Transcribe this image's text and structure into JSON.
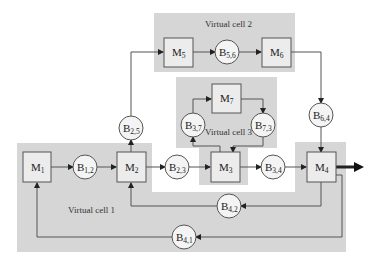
{
  "diagram": {
    "type": "manufacturing-flow-network",
    "virtual_cells": [
      {
        "id": "vc1",
        "label": "Virtual cell 1"
      },
      {
        "id": "vc2",
        "label": "Virtual cell 2"
      },
      {
        "id": "vc3",
        "label": "Virtual cell 3"
      }
    ],
    "machines": [
      {
        "id": "M1",
        "base": "M",
        "sub": "1"
      },
      {
        "id": "M2",
        "base": "M",
        "sub": "2"
      },
      {
        "id": "M3",
        "base": "M",
        "sub": "3"
      },
      {
        "id": "M4",
        "base": "M",
        "sub": "4"
      },
      {
        "id": "M5",
        "base": "M",
        "sub": "5"
      },
      {
        "id": "M6",
        "base": "M",
        "sub": "6"
      },
      {
        "id": "M7",
        "base": "M",
        "sub": "7"
      }
    ],
    "buffers": [
      {
        "id": "B12",
        "base": "B",
        "sub": "1,2"
      },
      {
        "id": "B23",
        "base": "B",
        "sub": "2,3"
      },
      {
        "id": "B34",
        "base": "B",
        "sub": "3,4"
      },
      {
        "id": "B25",
        "base": "B",
        "sub": "2,5"
      },
      {
        "id": "B56",
        "base": "B",
        "sub": "5,6"
      },
      {
        "id": "B64",
        "base": "B",
        "sub": "6,4"
      },
      {
        "id": "B37",
        "base": "B",
        "sub": "3,7"
      },
      {
        "id": "B73",
        "base": "B",
        "sub": "7,3"
      },
      {
        "id": "B42",
        "base": "B",
        "sub": "4,2"
      },
      {
        "id": "B41",
        "base": "B",
        "sub": "4,1"
      }
    ],
    "edges": [
      [
        "M1",
        "B12"
      ],
      [
        "B12",
        "M2"
      ],
      [
        "M2",
        "B23"
      ],
      [
        "B23",
        "M3"
      ],
      [
        "M3",
        "B34"
      ],
      [
        "B34",
        "M4"
      ],
      [
        "M2",
        "B25"
      ],
      [
        "B25",
        "M5"
      ],
      [
        "M5",
        "B56"
      ],
      [
        "B56",
        "M6"
      ],
      [
        "M6",
        "B64"
      ],
      [
        "B64",
        "M4"
      ],
      [
        "M3",
        "B37"
      ],
      [
        "B37",
        "M7"
      ],
      [
        "M7",
        "B73"
      ],
      [
        "B73",
        "M3"
      ],
      [
        "M4",
        "B42"
      ],
      [
        "B42",
        "M2"
      ],
      [
        "M4",
        "B41"
      ],
      [
        "B41",
        "M1"
      ],
      [
        "M4",
        "output"
      ]
    ]
  }
}
